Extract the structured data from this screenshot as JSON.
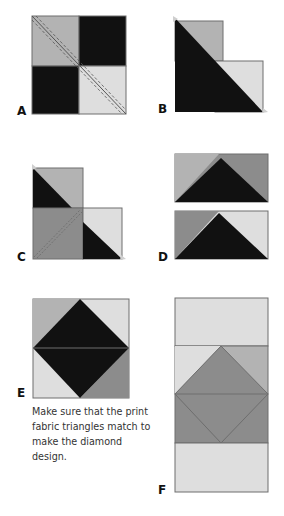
{
  "figure": {
    "panels": [
      {
        "id": "A",
        "label": "A"
      },
      {
        "id": "B",
        "label": "B"
      },
      {
        "id": "C",
        "label": "C"
      },
      {
        "id": "D",
        "label": "D"
      },
      {
        "id": "E",
        "label": "E"
      },
      {
        "id": "F",
        "label": "F"
      }
    ],
    "note": "Make sure that the print fabric triangles match to make the diamond design."
  },
  "colors": {
    "dark": "#111111",
    "medium_light": "#b3b3b3",
    "light": "#dedede",
    "medium": "#8c8c8c",
    "outline": "#6e6e6e",
    "stitch": "#555555"
  }
}
